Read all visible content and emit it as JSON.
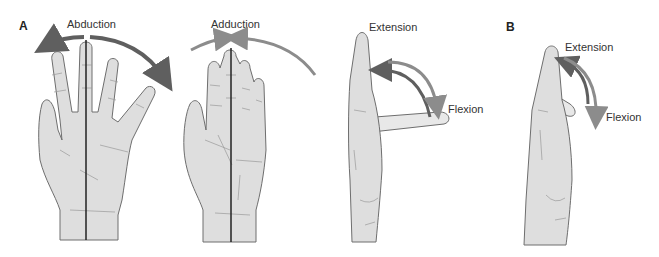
{
  "panels": {
    "a": {
      "letter": "A"
    },
    "b": {
      "letter": "B"
    }
  },
  "labels": {
    "abduction": "Abduction",
    "adduction": "Adduction",
    "extension_a": "Extension",
    "flexion_a": "Flexion",
    "extension_b": "Extension",
    "flexion_b": "Flexion"
  },
  "colors": {
    "skin": "#dedede",
    "outline": "#6e6e6e",
    "crease": "#9a9a9a",
    "axis_line": "#222222",
    "arrow_dark": "#5f5f5f",
    "arrow_light": "#8c8c8c",
    "text": "#333333"
  }
}
